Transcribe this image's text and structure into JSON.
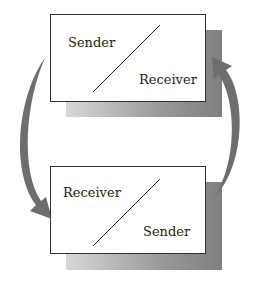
{
  "diagram": {
    "type": "communication-cycle",
    "top_box": {
      "upper_left_label": "Sender",
      "lower_right_label": "Receiver"
    },
    "bottom_box": {
      "upper_left_label": "Receiver",
      "lower_right_label": "Sender"
    },
    "arrows": [
      {
        "name": "left-arrow",
        "from": "top_box",
        "to": "bottom_box",
        "direction": "down"
      },
      {
        "name": "right-arrow",
        "from": "bottom_box",
        "to": "top_box",
        "direction": "up"
      }
    ],
    "colors": {
      "arrow": "#6e6e6e",
      "border": "#333333",
      "shadow": "#8a8a8a"
    }
  }
}
